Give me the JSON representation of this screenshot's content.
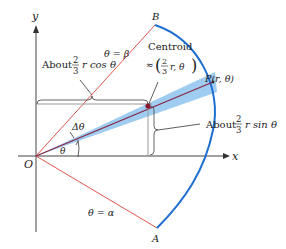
{
  "diagram": {
    "axes": {
      "x_label": "x",
      "y_label": "y",
      "origin_label": "O"
    },
    "rays": {
      "beta_label": "θ = β",
      "alpha_label": "θ = α"
    },
    "points": {
      "B": "B",
      "A": "A",
      "P": "P(r, θ)"
    },
    "centroid": {
      "title": "Centroid",
      "approx": "≈",
      "frac_num": "2",
      "frac_den": "3",
      "rest": "r,  θ"
    },
    "angles": {
      "delta_theta": "Δθ",
      "theta": "θ"
    },
    "annotations": {
      "cos": {
        "prefix": "About",
        "frac_num": "2",
        "frac_den": "3",
        "suffix": "r cos θ"
      },
      "sin": {
        "prefix": "About",
        "frac_num": "2",
        "frac_den": "3",
        "suffix": "r sin θ"
      }
    },
    "colors": {
      "ray": "#e0564f",
      "arc": "#1f6fd1",
      "wedge": "#8ec3ee",
      "radius": "#8a2443",
      "axis": "#333333",
      "guide": "#999999"
    }
  }
}
